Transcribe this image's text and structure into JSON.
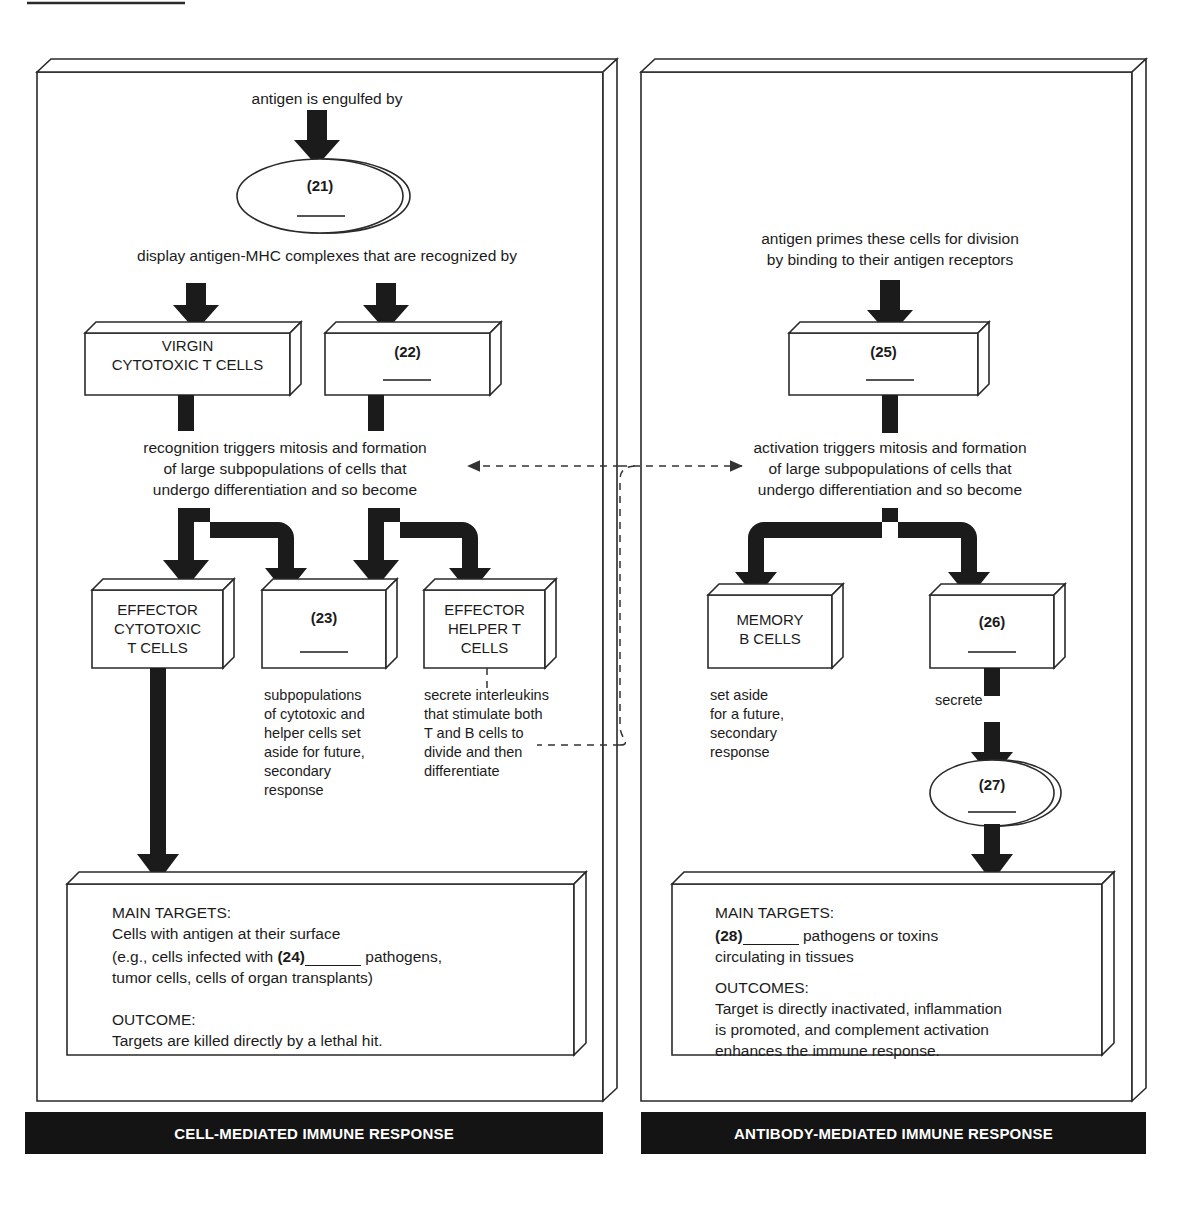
{
  "figure": {
    "type": "flowchart",
    "title_rule": true,
    "panels": [
      {
        "id": "cell-mediated",
        "banner": "CELL-MEDIATED IMMUNE RESPONSE",
        "captions": {
          "top": "antigen is engulfed by",
          "mid": "display antigen-MHC complexes that are recognized by",
          "branch": "recognition triggers mitosis and formation\nof large subpopulations of cells that\nundergo differentiation and so become"
        },
        "branch_lines": [
          "recognition triggers mitosis and formation",
          "of large subpopulations of cells that",
          "undergo differentiation and so become"
        ],
        "nodes": {
          "ellipse21": "(21)",
          "box_virgin": [
            "VIRGIN",
            "CYTOTOXIC T CELLS"
          ],
          "box22": "(22)",
          "box_effector_cyto": [
            "EFFECTOR",
            "CYTOTOXIC",
            "T CELLS"
          ],
          "box23": "(23)",
          "box_effector_helper": [
            "EFFECTOR",
            "HELPER T",
            "CELLS"
          ]
        },
        "note_23": [
          "subpopulations",
          "of cytotoxic and",
          "helper cells set",
          "aside for future,",
          "secondary",
          "response"
        ],
        "note_helper": [
          "secrete interleukins",
          "that stimulate both",
          "T and B cells to",
          "divide and then",
          "differentiate"
        ],
        "summary": {
          "heading_targets": "MAIN TARGETS:",
          "targets_line1": "Cells with antigen at their surface",
          "targets_line2_a": "(e.g., cells infected with ",
          "targets_line2_num": "(24)",
          "targets_line2_b": " pathogens,",
          "targets_line3": "tumor cells, cells of organ transplants)",
          "heading_outcome": "OUTCOME:",
          "outcome_line1": "Targets are killed directly by a lethal hit."
        }
      },
      {
        "id": "antibody-mediated",
        "banner": "ANTIBODY-MEDIATED IMMUNE RESPONSE",
        "captions": {
          "top_line1": "antigen primes these cells for division",
          "top_line2": "by binding to their antigen receptors"
        },
        "branch_lines": [
          "activation triggers mitosis and formation",
          "of large subpopulations of cells that",
          "undergo differentiation and so become"
        ],
        "nodes": {
          "box25": "(25)",
          "box_memory_b": [
            "MEMORY",
            "B CELLS"
          ],
          "box26": "(26)",
          "ellipse27": "(27)"
        },
        "note_memory": [
          "set aside",
          "for a future,",
          "secondary",
          "response"
        ],
        "label_secrete": "secrete",
        "summary": {
          "heading_targets": "MAIN TARGETS:",
          "targets_num": "(28)",
          "targets_line1_b": " pathogens or toxins",
          "targets_line2": "circulating in tissues",
          "heading_outcome": "OUTCOMES:",
          "outcome_line1": "Target is directly inactivated, inflammation",
          "outcome_line2": "is promoted, and complement activation",
          "outcome_line3": "enhances the immune response."
        }
      }
    ],
    "cross_links": {
      "left_arrow_label": "",
      "right_arrow_label": ""
    },
    "colors": {
      "ink": "#1b1b1b",
      "paper": "#ffffff",
      "banner_bg": "#141414",
      "banner_text": "#ffffff",
      "arrow_fill": "#1b1b1b"
    }
  }
}
